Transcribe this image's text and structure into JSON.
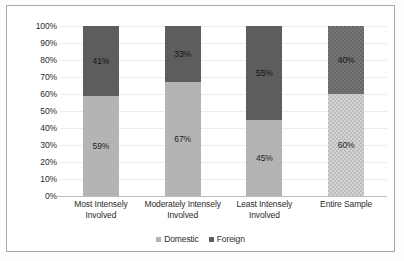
{
  "chart_data": {
    "type": "bar",
    "subtype": "stacked-100-percent",
    "title": "",
    "xlabel": "",
    "ylabel": "",
    "ylim": [
      0,
      100
    ],
    "ytick_labels": [
      "100%",
      "90%",
      "80%",
      "70%",
      "60%",
      "50%",
      "40%",
      "30%",
      "20%",
      "10%",
      "0%"
    ],
    "ytick_values": [
      100,
      90,
      80,
      70,
      60,
      50,
      40,
      30,
      20,
      10,
      0
    ],
    "grid": true,
    "legend_position": "bottom",
    "categories": [
      "Most Intensely Involved",
      "Moderately Intensely Involved",
      "Least Intensely Involved",
      "Entire Sample"
    ],
    "category_lines": [
      [
        "Most Intensely",
        "Involved"
      ],
      [
        "Moderately Intensely",
        "Involved"
      ],
      [
        "Least Intensely",
        "Involved"
      ],
      [
        "Entire Sample"
      ]
    ],
    "series": [
      {
        "name": "Domestic",
        "color": "#b4b4b4",
        "values": [
          59,
          67,
          45,
          60
        ],
        "labels": [
          "59%",
          "67%",
          "45%",
          "60%"
        ]
      },
      {
        "name": "Foreign",
        "color": "#5d5d5d",
        "values": [
          41,
          33,
          55,
          40
        ],
        "labels": [
          "41%",
          "33%",
          "55%",
          "40%"
        ]
      }
    ]
  },
  "legend": {
    "items": [
      {
        "label": "Domestic",
        "color": "#b4b4b4"
      },
      {
        "label": "Foreign",
        "color": "#5d5d5d"
      }
    ]
  },
  "colors": {
    "domestic": "#b4b4b4",
    "foreign": "#5d5d5d",
    "gridline": "#ececec",
    "axis": "#bdbdbd",
    "frame": "#a8a8a8",
    "text": "#2b2b2b"
  }
}
